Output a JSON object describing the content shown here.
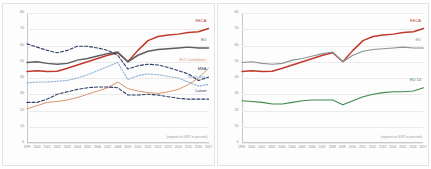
{
  "footnote": "(exports to GDP in percent)",
  "colors": {
    "eeca": "#c0392b",
    "eu": "#5d5d66",
    "eu_candidates": "#d9956b",
    "mea": "#2b3d63",
    "south_asia": "#8fb4d9",
    "latam": "#2b3d63",
    "eu14": "#3d8b4a",
    "grid": "#eceaea",
    "axis": "#c8c8c8",
    "tick_text": "#8a8a8a"
  },
  "chart_data": [
    {
      "type": "line",
      "title": "",
      "xlabel": "",
      "ylabel": "",
      "note": "(exports to GDP in percent)",
      "grid": true,
      "legend": "inline-right",
      "ylim": [
        0,
        80
      ],
      "yticks": [
        "0",
        "10",
        "20",
        "30",
        "40",
        "50",
        "60",
        "70",
        "80"
      ],
      "x": [
        "1999",
        "2000",
        "2001",
        "2002",
        "2003",
        "2004",
        "2005",
        "2006",
        "2007",
        "2008",
        "2009",
        "2010",
        "2011",
        "2012",
        "2013",
        "2014",
        "2015",
        "2016",
        "2017"
      ],
      "series": [
        {
          "name": "EECA",
          "color": "#c0392b",
          "style": "solid",
          "width": 1.5,
          "label": "EECA",
          "values": [
            44,
            44.5,
            44,
            44.2,
            46,
            48,
            50,
            52,
            54,
            55.5,
            50,
            57,
            63,
            65.5,
            66.5,
            67,
            68,
            68.5,
            70.5
          ]
        },
        {
          "name": "EU",
          "color": "#5d5d66",
          "style": "solid",
          "width": 1.5,
          "label": "EU",
          "values": [
            49.5,
            50,
            49,
            48.5,
            49,
            51,
            52,
            53.5,
            55,
            56,
            50,
            54,
            56.5,
            57.5,
            58,
            58.5,
            59,
            58.5,
            58.5
          ]
        },
        {
          "name": "EU Candidates",
          "color": "#d9956b",
          "style": "solid",
          "width": 1.0,
          "label": "EU Candidates",
          "values": [
            21,
            23,
            25,
            25.5,
            26.5,
            28,
            30,
            32,
            34,
            37.5,
            33.5,
            32,
            31,
            30.5,
            31.5,
            33,
            36,
            40,
            46
          ]
        },
        {
          "name": "MEA",
          "color": "#2b3d63",
          "style": "dashed",
          "width": 1.1,
          "label": "MEA",
          "values": [
            61,
            59,
            57,
            55.5,
            57,
            59.5,
            59.5,
            58.5,
            57,
            54,
            45.5,
            47.5,
            48.5,
            48,
            46.5,
            44.5,
            42.5,
            38.5,
            40.5
          ]
        },
        {
          "name": "South Asia",
          "color": "#8fb4d9",
          "style": "dotted",
          "width": 1.1,
          "label": "South Asia",
          "values": [
            37,
            37.5,
            37.5,
            38,
            38.5,
            40,
            42,
            44.5,
            47,
            49.5,
            39,
            41.5,
            42.5,
            42,
            41,
            40,
            37.5,
            35,
            36
          ]
        },
        {
          "name": "Latam",
          "color": "#2b3d63",
          "style": "dashed",
          "width": 1.1,
          "label": "Latam",
          "values": [
            25,
            25,
            27,
            30,
            31.5,
            33,
            34,
            34.5,
            34.5,
            34,
            29.5,
            29.5,
            30,
            29.5,
            28.5,
            27.5,
            27,
            27,
            27
          ]
        }
      ]
    },
    {
      "type": "line",
      "title": "",
      "xlabel": "",
      "ylabel": "",
      "note": "(exports to GDP in percent)",
      "grid": true,
      "legend": "inline-right",
      "ylim": [
        0,
        80
      ],
      "yticks": [
        "0",
        "10",
        "20",
        "30",
        "40",
        "50",
        "60",
        "70",
        "80"
      ],
      "x": [
        "1999",
        "2000",
        "2001",
        "2002",
        "2003",
        "2004",
        "2005",
        "2006",
        "2007",
        "2008",
        "2009",
        "2010",
        "2011",
        "2012",
        "2013",
        "2014",
        "2015",
        "2016",
        "2017"
      ],
      "series": [
        {
          "name": "EECA",
          "color": "#c0392b",
          "style": "solid",
          "width": 1.5,
          "label": "EECA",
          "values": [
            44,
            44.5,
            44,
            44.2,
            46,
            48,
            50,
            52,
            54,
            55.5,
            50,
            57,
            63,
            65.5,
            66.5,
            67,
            68,
            68.5,
            70.5
          ]
        },
        {
          "name": "EU",
          "color": "#8c9298",
          "style": "solid",
          "width": 1.1,
          "label": "EU",
          "values": [
            49.5,
            50,
            49,
            48.5,
            49,
            51,
            52,
            53.5,
            55,
            56,
            50,
            54,
            56.5,
            57.5,
            58,
            58.5,
            59,
            58.5,
            58.5
          ]
        },
        {
          "name": "EU 14",
          "color": "#3d8b4a",
          "style": "solid",
          "width": 1.1,
          "label": "EU 14",
          "values": [
            26,
            25.5,
            25,
            24,
            24,
            25,
            26,
            26.5,
            26.5,
            26.5,
            23.5,
            26,
            28.5,
            30,
            31,
            31.5,
            31.5,
            32,
            34
          ]
        }
      ]
    }
  ]
}
